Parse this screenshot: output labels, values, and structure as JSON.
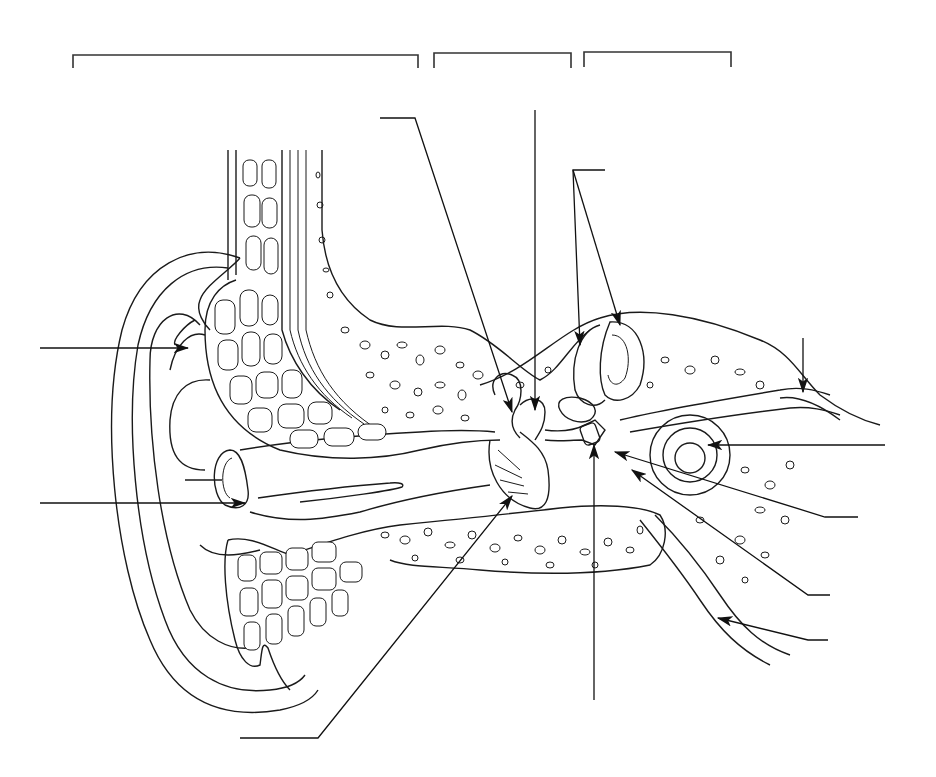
{
  "diagram": {
    "background": "#ffffff",
    "line_color": "#1a1a1a",
    "region_brackets": [
      {
        "id": "outer-ear-bracket",
        "x1": 73,
        "x2": 418,
        "y": 55,
        "label": ""
      },
      {
        "id": "middle-ear-bracket",
        "x1": 434,
        "x2": 571,
        "y": 53,
        "label": ""
      },
      {
        "id": "inner-ear-bracket",
        "x1": 584,
        "x2": 731,
        "y": 52,
        "label": ""
      }
    ],
    "label_slots": [
      {
        "id": "pinna-label",
        "label": "",
        "line": [
          40,
          348,
          188,
          348
        ]
      },
      {
        "id": "ear-canal-label",
        "label": "",
        "line": [
          40,
          503,
          245,
          503
        ]
      },
      {
        "id": "eardrum-label",
        "label": "",
        "line": [
          240,
          738,
          318,
          738
        ]
      },
      {
        "id": "malleus-label",
        "label": "",
        "line": [
          380,
          118,
          415,
          118
        ]
      },
      {
        "id": "incus-label",
        "label": "",
        "line": [
          535,
          110,
          535,
          410
        ]
      },
      {
        "id": "semicircular-canals-label",
        "label": "",
        "line": [
          573,
          170,
          605,
          170
        ]
      },
      {
        "id": "vestibular-nerve-label",
        "label": "",
        "line": [
          803,
          338,
          803,
          392
        ]
      },
      {
        "id": "cochlea-label",
        "label": "",
        "line": [
          885,
          445,
          708,
          445
        ]
      },
      {
        "id": "oval-window-label",
        "label": "",
        "line": [
          858,
          517,
          825,
          517
        ]
      },
      {
        "id": "round-window-label",
        "label": "",
        "line": [
          830,
          595,
          808,
          595
        ]
      },
      {
        "id": "eustachian-tube-label",
        "label": "",
        "line": [
          828,
          640,
          808,
          640
        ]
      },
      {
        "id": "stapes-label",
        "label": "",
        "line": [
          594,
          700,
          594,
          445
        ]
      }
    ]
  }
}
